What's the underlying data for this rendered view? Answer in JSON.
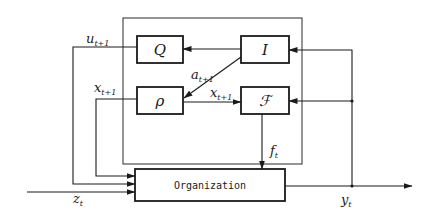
{
  "diagram": {
    "blocks": {
      "Q": "Q",
      "I": "I",
      "P": "ρ",
      "F": "ℱ",
      "organization": "Organization"
    },
    "signals": {
      "u": {
        "base": "u",
        "sub": "t+1"
      },
      "a": {
        "base": "a",
        "sub": "t+1"
      },
      "x_left": {
        "base": "x",
        "sub": "t+1"
      },
      "x_mid": {
        "base": "x",
        "sub": "t+1"
      },
      "f": {
        "base": "f",
        "sub": "t"
      },
      "z": {
        "base": "z",
        "sub": "t"
      },
      "y": {
        "base": "y",
        "sub": "t"
      }
    },
    "edges": [
      {
        "from": "I",
        "to": "Q"
      },
      {
        "from": "I",
        "to": "P",
        "label": "a"
      },
      {
        "from": "P",
        "to": "F",
        "label": "x_mid"
      },
      {
        "from": "y",
        "to": "I"
      },
      {
        "from": "y",
        "to": "F"
      },
      {
        "from": "Q",
        "to": "organization",
        "label": "u"
      },
      {
        "from": "P",
        "to": "organization",
        "label": "x_left"
      },
      {
        "from": "F",
        "to": "organization",
        "label": "f"
      },
      {
        "from": "input",
        "to": "organization",
        "label": "z"
      },
      {
        "from": "organization",
        "to": "output",
        "label": "y"
      }
    ]
  }
}
